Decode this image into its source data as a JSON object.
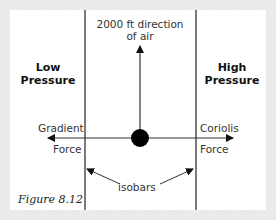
{
  "diagram": {
    "top_label": [
      "2000 ft direction",
      "of air"
    ],
    "left_region": [
      "Low",
      "Pressure"
    ],
    "right_region": [
      "High",
      "Pressure"
    ],
    "left_force": [
      "Gradient",
      "Force"
    ],
    "right_force": [
      "Coriolis",
      "Force"
    ],
    "isobars_label": "isobars",
    "caption": "Figure 8.12",
    "colors": {
      "line": "#222222",
      "dot": "#000000",
      "background": "#ffffff",
      "border": "#e9e9e9"
    }
  }
}
